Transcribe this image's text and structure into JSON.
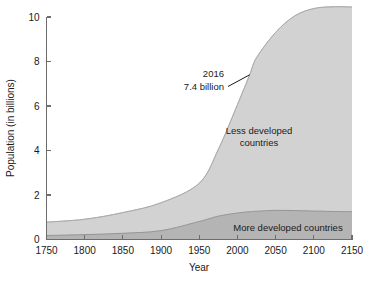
{
  "chart_data": {
    "type": "area",
    "title": "",
    "xlabel": "Year",
    "ylabel": "Population (in billions)",
    "xlim": [
      1750,
      2150
    ],
    "ylim": [
      0,
      10.4
    ],
    "xticks": [
      1750,
      1800,
      1850,
      1900,
      1950,
      2000,
      2050,
      2100,
      2150
    ],
    "yticks": [
      0,
      2,
      4,
      6,
      8,
      10
    ],
    "grid": false,
    "legend_position": "inline-labels",
    "stacked": true,
    "x": [
      1750,
      1800,
      1850,
      1900,
      1950,
      1975,
      2000,
      2016,
      2025,
      2050,
      2075,
      2100,
      2125,
      2150
    ],
    "series": [
      {
        "name": "More developed countries",
        "label": "More developed countries",
        "color": "#b4b4b4",
        "values": [
          0.18,
          0.22,
          0.28,
          0.4,
          0.81,
          1.05,
          1.19,
          1.25,
          1.27,
          1.31,
          1.3,
          1.28,
          1.26,
          1.25
        ]
      },
      {
        "name": "Less developed countries",
        "label": "Less developed countries",
        "color": "#d2d2d2",
        "values": [
          0.6,
          0.69,
          0.93,
          1.25,
          1.72,
          3.0,
          4.87,
          6.15,
          6.9,
          8.0,
          8.75,
          9.1,
          9.2,
          9.2
        ]
      }
    ],
    "upper_envelope": {
      "name": "total-population-outline",
      "color": "#e2e2e2",
      "values": [
        0.78,
        0.91,
        1.21,
        1.65,
        2.53,
        4.05,
        6.06,
        7.4,
        8.17,
        9.31,
        10.05,
        10.38,
        10.46,
        10.45
      ]
    },
    "annotations": [
      {
        "name": "population-2016-callout",
        "line1": "2016",
        "line2": "7.4 billion",
        "x_value": 2016,
        "y_value": 7.4
      }
    ]
  },
  "axes": {
    "x_title": "Year",
    "y_title": "Population (in billions)",
    "x_tick_labels": [
      "1750",
      "1800",
      "1850",
      "1900",
      "1950",
      "2000",
      "2050",
      "2100",
      "2150"
    ],
    "y_tick_labels": [
      "0",
      "2",
      "4",
      "6",
      "8",
      "10"
    ]
  },
  "labels": {
    "less_developed_line1": "Less developed",
    "less_developed_line2": "countries",
    "more_developed": "More developed countries"
  },
  "annotation": {
    "year": "2016",
    "value": "7.4 billion"
  },
  "colors": {
    "upper_band": "#e2e2e2",
    "middle_band": "#d2d2d2",
    "lower_band": "#b4b4b4",
    "axis": "#6d6d6d",
    "text": "#1a1a1a"
  }
}
